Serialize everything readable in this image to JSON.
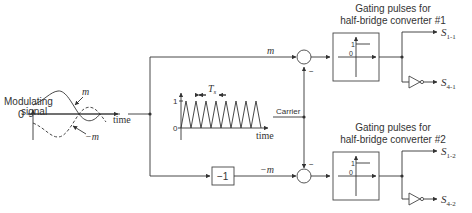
{
  "modulating": {
    "title_line1": "Modulating",
    "title_line2": "signal",
    "zero_label": "0",
    "time_label": "time",
    "m_label": "m",
    "neg_m_label": "−m"
  },
  "carrier": {
    "one_label": "1",
    "zero_label": "0",
    "period_label": "T",
    "period_sub": "s",
    "time_label": "time",
    "label": "Carrier"
  },
  "paths": {
    "top_signal": "m",
    "bottom_signal": "−m",
    "inverter_gain": "−1",
    "minus_sign": "−"
  },
  "comparators": [
    {
      "title_line1": "Gating pulses for",
      "title_line2": "half-bridge converter #1",
      "one_label": "1",
      "zero_label": "0",
      "out_top": "S",
      "out_top_sub": "1-1",
      "out_bottom": "S",
      "out_bottom_sub": "4-1"
    },
    {
      "title_line1": "Gating pulses for",
      "title_line2": "half-bridge converter #2",
      "one_label": "1",
      "zero_label": "0",
      "out_top": "S",
      "out_top_sub": "1-2",
      "out_bottom": "S",
      "out_bottom_sub": "4-2"
    }
  ]
}
